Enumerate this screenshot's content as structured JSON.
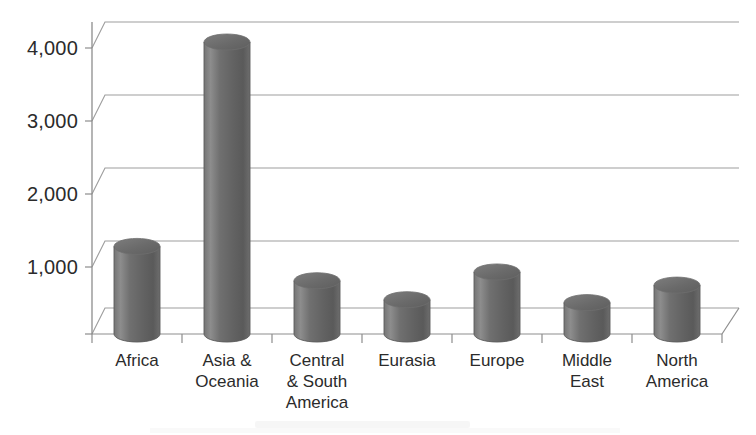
{
  "chart_data": {
    "type": "bar",
    "title": "",
    "subtitle": "",
    "xlabel": "",
    "ylabel": "",
    "categories": [
      "Africa",
      "Asia & Oceania",
      "Central & South America",
      "Eurasia",
      "Europe",
      "Middle East",
      "North America"
    ],
    "category_lines": [
      [
        "Africa"
      ],
      [
        "Asia &",
        "Oceania"
      ],
      [
        "Central",
        "& South",
        "America"
      ],
      [
        "Eurasia"
      ],
      [
        "Europe"
      ],
      [
        "Middle",
        "East"
      ],
      [
        "North",
        "America"
      ]
    ],
    "values": [
      1200,
      4000,
      730,
      470,
      850,
      430,
      670
    ],
    "ylim": [
      0,
      5000
    ],
    "yticks": [
      1000,
      2000,
      3000,
      4000
    ],
    "ytick_labels": [
      "1,000",
      "2,000",
      "3,000",
      "4,000"
    ],
    "grid": true,
    "gridlines_at": [
      1000,
      2000,
      3000,
      4000,
      5000
    ],
    "legend": "none",
    "style": "3d-cylinder",
    "bar_color": "#6e6e6e",
    "bar_color_light": "#8e8e8e",
    "bar_color_dark": "#4f4f4f",
    "axis_color": "#8a8a8a",
    "grid_color": "#9a9a9a",
    "text_color": "#2b2b2b",
    "background": "#ffffff"
  }
}
